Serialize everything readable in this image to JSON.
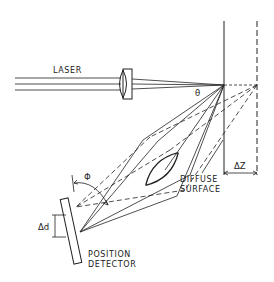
{
  "diagram": {
    "labels": {
      "laser": "LASER",
      "theta": "θ",
      "phi": "Φ",
      "delta_d": "Δd",
      "delta_z": "ΔZ",
      "diffuse_line1": "DIFFUSE",
      "diffuse_line2": "SURFACE",
      "detector_line1": "POSITION",
      "detector_line2": "DETECTOR"
    },
    "colors": {
      "ink": "#222222",
      "background": "#ffffff"
    }
  }
}
